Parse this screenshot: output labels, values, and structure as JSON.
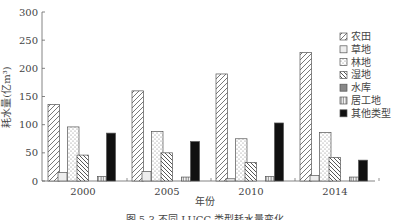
{
  "chart_data": {
    "type": "bar",
    "title": "",
    "xlabel": "年份",
    "ylabel": "耗水量(亿m³)",
    "ylim": [
      0,
      300
    ],
    "yticks": [
      0,
      50,
      100,
      150,
      200,
      250,
      300
    ],
    "categories": [
      "2000",
      "2005",
      "2010",
      "2014"
    ],
    "series": [
      {
        "name": "农田",
        "pattern": "diag-forward",
        "values": [
          136,
          160,
          190,
          228
        ]
      },
      {
        "name": "草地",
        "pattern": "light-fill",
        "values": [
          15,
          17,
          4,
          10
        ]
      },
      {
        "name": "林地",
        "pattern": "dots",
        "values": [
          96,
          88,
          75,
          86
        ]
      },
      {
        "name": "湿地",
        "pattern": "diag-back",
        "values": [
          46,
          50,
          33,
          42
        ]
      },
      {
        "name": "水库",
        "pattern": "gray-fill",
        "values": [
          0,
          0,
          0,
          0
        ]
      },
      {
        "name": "居工地",
        "pattern": "vertical-lines",
        "values": [
          8,
          7,
          8,
          7
        ]
      },
      {
        "name": "其他类型",
        "pattern": "black-fill",
        "values": [
          85,
          70,
          103,
          37
        ]
      }
    ],
    "grid": false,
    "legend_position": "right"
  },
  "caption": "图 5-3  不同 LUCC 类型耗水量变化"
}
